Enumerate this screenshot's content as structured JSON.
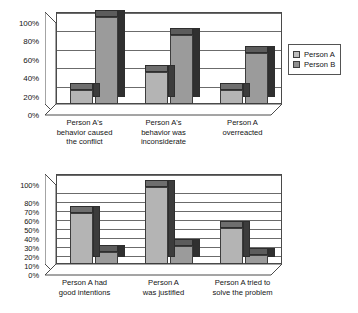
{
  "legend": {
    "series": [
      {
        "key": "a",
        "label": "Person A",
        "color": "#b4b4b4"
      },
      {
        "key": "b",
        "label": "Person B",
        "color": "#9b9b9b"
      }
    ]
  },
  "chart_data": [
    {
      "type": "bar",
      "title": "",
      "xlabel": "",
      "ylabel": "",
      "ylim": [
        0,
        100
      ],
      "yticks": [
        "0%",
        "20%",
        "40%",
        "60%",
        "80%",
        "100%"
      ],
      "ytick_values": [
        0,
        20,
        40,
        60,
        80,
        100
      ],
      "grid": true,
      "legend_position": "right",
      "categories": [
        "Person A's behavior caused the conflict",
        "Person A's behavior was inconsiderate",
        "Person A overreacted"
      ],
      "series": [
        {
          "name": "Person A",
          "values": [
            15,
            35,
            15
          ]
        },
        {
          "name": "Person B",
          "values": [
            95,
            75,
            55
          ]
        }
      ]
    },
    {
      "type": "bar",
      "title": "",
      "xlabel": "",
      "ylabel": "",
      "ylim": [
        0,
        100
      ],
      "yticks": [
        "0%",
        "10%",
        "20%",
        "30%",
        "40%",
        "50%",
        "60%",
        "70%",
        "80%",
        "100%"
      ],
      "ytick_values": [
        0,
        10,
        20,
        30,
        40,
        50,
        60,
        70,
        80,
        100
      ],
      "grid": true,
      "legend_position": "right",
      "categories": [
        "Person A had good intentions",
        "Person A was justified",
        "Person A tried to solve the problem"
      ],
      "series": [
        {
          "name": "Person A",
          "values": [
            57,
            86,
            40
          ]
        },
        {
          "name": "Person B",
          "values": [
            13,
            20,
            10
          ]
        }
      ]
    }
  ],
  "charts": [
    {
      "ytick_labels": [
        "100%",
        "80%",
        "60%",
        "40%",
        "20%",
        "0%"
      ],
      "category_lines": [
        [
          "Person A's",
          "behavior caused",
          "the conflict"
        ],
        [
          "Person A's",
          "behavior was",
          "inconsiderate"
        ],
        [
          "Person A",
          "overreacted"
        ]
      ]
    },
    {
      "ytick_labels": [
        "100%",
        "80%",
        "70%",
        "60%",
        "50%",
        "40%",
        "30%",
        "20%",
        "10%",
        "0%"
      ],
      "category_lines": [
        [
          "Person A had",
          "good intentions"
        ],
        [
          "Person A",
          "was justified"
        ],
        [
          "Person A tried to",
          "solve the problem"
        ]
      ]
    }
  ]
}
